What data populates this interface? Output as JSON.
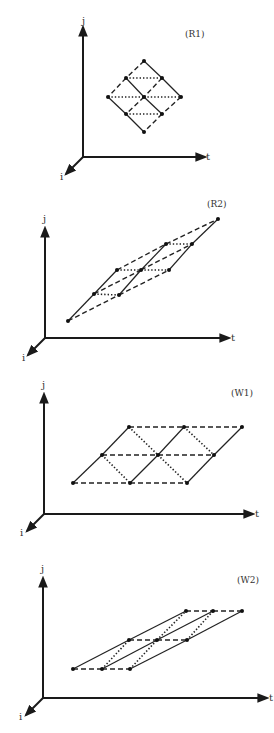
{
  "diagrams": [
    {
      "id": "R1",
      "label": "(R1)",
      "label_pos": [
        185,
        37
      ],
      "axes": {
        "origin": [
          83,
          157
        ],
        "j_tip": [
          83,
          27
        ],
        "t_tip": [
          205,
          157
        ],
        "i_tip": [
          66,
          174
        ],
        "j_label": "j",
        "t_label": "t",
        "i_label": "i",
        "j_label_pos": [
          82,
          24
        ],
        "t_label_pos": [
          206,
          160
        ],
        "i_label_pos": [
          60,
          180
        ]
      },
      "points": [
        [
          144,
          61
        ],
        [
          126,
          78
        ],
        [
          162,
          78
        ],
        [
          108,
          97
        ],
        [
          144,
          97
        ],
        [
          181,
          97
        ],
        [
          126,
          114
        ],
        [
          162,
          114
        ],
        [
          144,
          132
        ]
      ],
      "solid": [
        [
          0,
          2
        ],
        [
          2,
          5
        ],
        [
          1,
          4
        ],
        [
          4,
          7
        ],
        [
          3,
          6
        ],
        [
          6,
          8
        ]
      ],
      "dashed": [
        [
          0,
          1
        ],
        [
          1,
          3
        ],
        [
          2,
          4
        ],
        [
          4,
          6
        ],
        [
          5,
          7
        ],
        [
          7,
          8
        ]
      ],
      "dotted": [
        [
          1,
          2
        ],
        [
          3,
          4
        ],
        [
          4,
          5
        ],
        [
          6,
          7
        ]
      ]
    },
    {
      "id": "R2",
      "label": "(R2)",
      "label_pos": [
        207,
        207
      ],
      "axes": {
        "origin": [
          45,
          338
        ],
        "j_tip": [
          45,
          228
        ],
        "t_tip": [
          229,
          338
        ],
        "i_tip": [
          28,
          355
        ],
        "j_label": "j",
        "t_label": "t",
        "i_label": "i",
        "j_label_pos": [
          43,
          222
        ],
        "t_label_pos": [
          231,
          341
        ],
        "i_label_pos": [
          22,
          361
        ]
      },
      "points": [
        [
          68,
          321
        ],
        [
          94,
          294
        ],
        [
          117,
          270
        ],
        [
          119,
          295
        ],
        [
          141,
          270
        ],
        [
          169,
          270
        ],
        [
          166,
          244
        ],
        [
          192,
          244
        ],
        [
          218,
          219
        ]
      ],
      "solid": [
        [
          0,
          1
        ],
        [
          1,
          2
        ],
        [
          3,
          4
        ],
        [
          4,
          6
        ],
        [
          5,
          7
        ],
        [
          7,
          8
        ]
      ],
      "dashed": [
        [
          0,
          3
        ],
        [
          3,
          5
        ],
        [
          1,
          4
        ],
        [
          4,
          7
        ],
        [
          2,
          6
        ],
        [
          6,
          8
        ]
      ],
      "dotted": [
        [
          1,
          3
        ],
        [
          2,
          4
        ],
        [
          4,
          5
        ],
        [
          6,
          7
        ]
      ]
    },
    {
      "id": "W1",
      "label": "(W1)",
      "label_pos": [
        231,
        396
      ],
      "axes": {
        "origin": [
          44,
          514
        ],
        "j_tip": [
          44,
          394
        ],
        "t_tip": [
          253,
          514
        ],
        "i_tip": [
          27,
          531
        ],
        "j_label": "j",
        "t_label": "t",
        "i_label": "i",
        "j_label_pos": [
          42,
          388
        ],
        "t_label_pos": [
          255,
          517
        ],
        "i_label_pos": [
          20,
          536
        ]
      },
      "points": [
        [
          73,
          483
        ],
        [
          130,
          483
        ],
        [
          187,
          483
        ],
        [
          102,
          455
        ],
        [
          158,
          455
        ],
        [
          214,
          455
        ],
        [
          129,
          427
        ],
        [
          184,
          427
        ],
        [
          242,
          427
        ]
      ],
      "solid": [
        [
          0,
          3
        ],
        [
          3,
          6
        ],
        [
          1,
          4
        ],
        [
          4,
          7
        ],
        [
          2,
          5
        ],
        [
          5,
          8
        ]
      ],
      "dashed": [
        [
          0,
          1
        ],
        [
          1,
          2
        ],
        [
          3,
          4
        ],
        [
          4,
          5
        ],
        [
          6,
          7
        ],
        [
          7,
          8
        ]
      ],
      "dotted": [
        [
          6,
          4
        ],
        [
          4,
          2
        ],
        [
          3,
          1
        ],
        [
          7,
          5
        ]
      ]
    },
    {
      "id": "W2",
      "label": "(W2)",
      "label_pos": [
        237,
        583
      ],
      "axes": {
        "origin": [
          43,
          698
        ],
        "j_tip": [
          43,
          578
        ],
        "t_tip": [
          267,
          698
        ],
        "i_tip": [
          26,
          715
        ],
        "j_label": "j",
        "t_label": "t",
        "i_label": "i",
        "j_label_pos": [
          41,
          572
        ],
        "t_label_pos": [
          269,
          701
        ],
        "i_label_pos": [
          19,
          720
        ]
      },
      "points": [
        [
          73,
          669
        ],
        [
          102,
          669
        ],
        [
          130,
          669
        ],
        [
          129,
          640
        ],
        [
          157,
          640
        ],
        [
          187,
          640
        ],
        [
          186,
          611
        ],
        [
          213,
          611
        ],
        [
          242,
          611
        ]
      ],
      "solid": [
        [
          0,
          3
        ],
        [
          3,
          6
        ],
        [
          1,
          4
        ],
        [
          4,
          7
        ],
        [
          2,
          5
        ],
        [
          5,
          8
        ]
      ],
      "dashed": [
        [
          0,
          1
        ],
        [
          1,
          2
        ],
        [
          3,
          4
        ],
        [
          4,
          5
        ],
        [
          6,
          7
        ],
        [
          7,
          8
        ]
      ],
      "dotted": [
        [
          1,
          3
        ],
        [
          2,
          4
        ],
        [
          4,
          6
        ],
        [
          5,
          7
        ]
      ]
    }
  ]
}
